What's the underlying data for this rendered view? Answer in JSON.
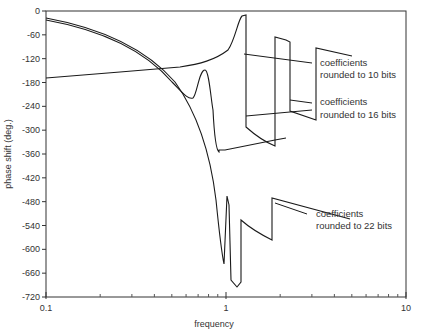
{
  "chart_data": {
    "type": "line",
    "title": "",
    "xlabel": "frequency",
    "ylabel": "phase shift (deg.)",
    "xscale": "log",
    "xlim": [
      0.1,
      10
    ],
    "ylim": [
      -720,
      0
    ],
    "xticks": [
      "0.1",
      "1",
      "10"
    ],
    "yticks": [
      "0",
      "-60",
      "-120",
      "-180",
      "-240",
      "-300",
      "-360",
      "-420",
      "-480",
      "-540",
      "-600",
      "-660",
      "-720"
    ],
    "grid": false,
    "legend": "none",
    "series": [
      {
        "name": "coefficients rounded to 10 bits",
        "x": [
          0.1,
          0.3,
          0.55,
          0.8,
          1.0,
          1.15,
          1.25,
          1.26,
          1.5,
          1.8,
          1.81,
          2.2,
          2.21,
          5.0
        ],
        "y": [
          -168,
          -150,
          -138,
          -125,
          -100,
          -30,
          -10,
          -300,
          -330,
          -260,
          -30,
          -25,
          -30,
          -90
        ]
      },
      {
        "name": "coefficients rounded to 16 bits",
        "x": [
          0.1,
          0.3,
          0.55,
          0.8,
          0.9,
          0.95,
          1.0,
          1.1,
          1.15,
          1.16,
          1.5,
          1.8,
          1.81,
          2.2,
          2.21,
          3.0
        ],
        "y": [
          -25,
          -60,
          -140,
          -190,
          -210,
          -180,
          -160,
          -210,
          -255,
          -280,
          -300,
          -315,
          -35,
          -280,
          -315,
          -330
        ]
      },
      {
        "name": "coefficients rounded to 22 bits",
        "x": [
          0.1,
          0.3,
          0.55,
          0.75,
          0.9,
          0.95,
          0.97,
          1.0,
          1.02,
          1.1,
          1.15,
          1.16,
          1.5,
          1.8,
          1.81,
          5.0
        ],
        "y": [
          -30,
          -70,
          -145,
          -300,
          -500,
          -630,
          -460,
          -470,
          -680,
          -700,
          -710,
          -600,
          -640,
          -660,
          -480,
          -440
        ]
      }
    ],
    "annotations": [
      {
        "line1": "coefficients",
        "line2": "rounded to 10 bits"
      },
      {
        "line1": "coefficients",
        "line2": "rounded to 16 bits"
      },
      {
        "line1": "coefficients",
        "line2": "rounded to 22 bits"
      }
    ]
  }
}
